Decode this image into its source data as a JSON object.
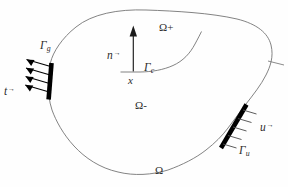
{
  "figure": {
    "kind": "continuum-domain-diagram",
    "width": 288,
    "height": 187,
    "background_color": "#fefefe",
    "line_color": "#6d6d6d",
    "boundary_segment_color": "#000000",
    "text_color": "#2b2b2b"
  },
  "labels": {
    "gamma_g": "Γ",
    "gamma_g_sub": "g",
    "traction": "t",
    "traction_arrow": "→",
    "normal": "n",
    "normal_arrow": "→",
    "point_x": "x",
    "gamma_c": "Γ",
    "gamma_c_sub": "c",
    "omega_plus": "Ω+",
    "omega_minus": "Ω-",
    "omega": "Ω",
    "displacement": "u",
    "displacement_arrow": "→",
    "gamma_u": "Γ",
    "gamma_u_sub": "u"
  }
}
